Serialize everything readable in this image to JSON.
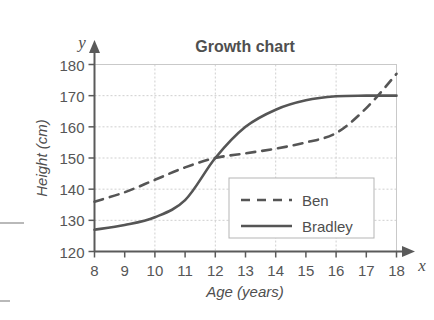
{
  "chart_data": {
    "type": "line",
    "title": "Growth chart",
    "xlabel": "Age (years)",
    "ylabel": "Height (cm)",
    "x_axis_name": "x",
    "y_axis_name": "y",
    "xlim": [
      8,
      18
    ],
    "ylim": [
      120,
      180
    ],
    "xticks": [
      8,
      9,
      10,
      11,
      12,
      13,
      14,
      15,
      16,
      17,
      18
    ],
    "yticks": [
      120,
      130,
      140,
      150,
      160,
      170,
      180
    ],
    "xtick_labels": [
      "8",
      "9",
      "10",
      "11",
      "12",
      "13",
      "14",
      "15",
      "16",
      "17",
      "18"
    ],
    "ytick_labels": [
      "120",
      "130",
      "140",
      "150",
      "160",
      "170",
      "180"
    ],
    "grid": true,
    "grid_x_step": 2,
    "grid_y_step": 10,
    "legend_position": "inside-lower-right",
    "x": [
      8,
      9,
      10,
      11,
      12,
      13,
      14,
      15,
      16,
      17,
      18
    ],
    "series": [
      {
        "name": "Ben",
        "style": "dashed",
        "color": "#555555",
        "values": [
          136,
          139,
          143,
          147,
          150,
          151.5,
          153,
          155,
          158,
          166,
          177
        ]
      },
      {
        "name": "Bradley",
        "style": "solid",
        "color": "#555555",
        "values": [
          127,
          128.5,
          131,
          136.5,
          150,
          160,
          165.5,
          168.5,
          169.8,
          170,
          170
        ]
      }
    ]
  },
  "colors": {
    "line": "#555555",
    "axis": "#5a5a5a",
    "grid": "#cfcfcf",
    "text": "#4f4f4f",
    "background": "#ffffff",
    "legend_border": "#b5b5b5"
  },
  "legend": {
    "items": [
      {
        "label": "Ben",
        "style": "dashed"
      },
      {
        "label": "Bradley",
        "style": "solid"
      }
    ]
  }
}
